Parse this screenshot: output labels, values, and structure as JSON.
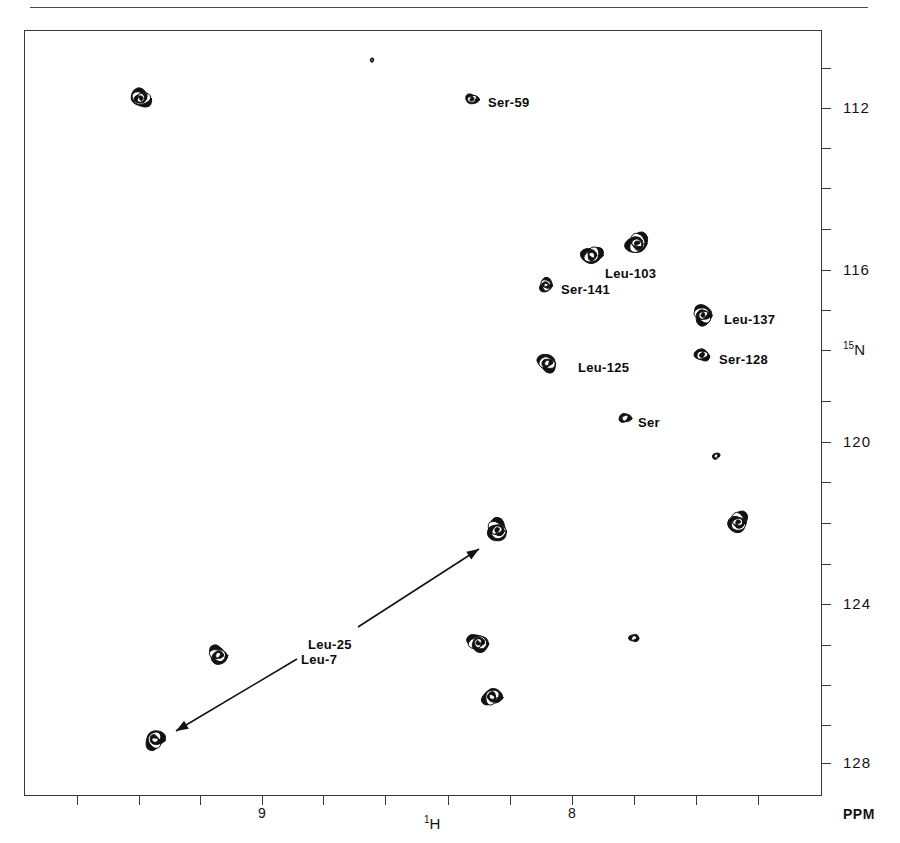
{
  "figure": {
    "kind": "2D NMR HSQC contour spectrum",
    "top_rule": true
  },
  "axes": {
    "x": {
      "title_pre": "1",
      "title": "H",
      "unit": "PPM",
      "labels": [
        "9",
        "8"
      ],
      "label_positions_px": [
        262,
        572
      ],
      "tick_positions_px": [
        77,
        139,
        200,
        262,
        323,
        385,
        448,
        510,
        572,
        634,
        696,
        758
      ],
      "range_ppm": [
        9.6,
        7.0
      ],
      "direction": "decreasing-left-to-right"
    },
    "y": {
      "title_pre": "15",
      "title": "N",
      "unit": "PPM",
      "labels": [
        "112",
        "116",
        "120",
        "124",
        "128"
      ],
      "label_positions_px": [
        108,
        270,
        442,
        604,
        763
      ],
      "tick_positions_px": [
        68,
        108,
        148,
        188,
        229,
        270,
        310,
        350,
        401,
        442,
        482,
        523,
        564,
        604,
        645,
        685,
        725,
        763
      ],
      "range_ppm": [
        110.2,
        128.4
      ],
      "direction": "increasing-top-to-bottom"
    }
  },
  "chart_data": {
    "type": "scatter",
    "title": "",
    "xlabel": "1H",
    "ylabel": "15N",
    "xlim": [
      9.6,
      7.0
    ],
    "ylim": [
      128.4,
      110.2
    ],
    "grid": false,
    "legend": "none",
    "peaks": [
      {
        "label": "",
        "x_px": 141,
        "y_px": 98,
        "h1_ppm": 9.21,
        "n15_ppm": 111.8,
        "size": 20,
        "rings": 4
      },
      {
        "label": "Ser-59",
        "x_px": 472,
        "y_px": 99,
        "h1_ppm": 8.14,
        "n15_ppm": 111.8,
        "size": 12,
        "rings": 2
      },
      {
        "label": "",
        "x_px": 592,
        "y_px": 255,
        "h1_ppm": 7.76,
        "n15_ppm": 115.7,
        "size": 20,
        "rings": 3
      },
      {
        "label": "Leu-103",
        "x_px": 637,
        "y_px": 243,
        "h1_ppm": 7.61,
        "n15_ppm": 115.4,
        "size": 22,
        "rings": 4
      },
      {
        "label": "Ser-141",
        "x_px": 546,
        "y_px": 285,
        "h1_ppm": 7.9,
        "n15_ppm": 116.5,
        "size": 14,
        "rings": 3
      },
      {
        "label": "Leu-137",
        "x_px": 703,
        "y_px": 315,
        "h1_ppm": 7.4,
        "n15_ppm": 117.2,
        "size": 20,
        "rings": 4
      },
      {
        "label": "Leu-125",
        "x_px": 547,
        "y_px": 363,
        "h1_ppm": 7.89,
        "n15_ppm": 118.4,
        "size": 19,
        "rings": 3
      },
      {
        "label": "Ser-128",
        "x_px": 702,
        "y_px": 355,
        "h1_ppm": 7.41,
        "n15_ppm": 118.2,
        "size": 14,
        "rings": 2
      },
      {
        "label": "Ser",
        "x_px": 625,
        "y_px": 418,
        "h1_ppm": 7.65,
        "n15_ppm": 119.8,
        "size": 11,
        "rings": 1
      },
      {
        "label": "",
        "x_px": 716,
        "y_px": 456,
        "h1_ppm": 7.36,
        "n15_ppm": 120.7,
        "size": 7,
        "rings": 1
      },
      {
        "label": "",
        "x_px": 738,
        "y_px": 522,
        "h1_ppm": 7.29,
        "n15_ppm": 122.4,
        "size": 21,
        "rings": 4
      },
      {
        "label": "",
        "x_px": 497,
        "y_px": 530,
        "h1_ppm": 8.06,
        "n15_ppm": 122.6,
        "size": 22,
        "rings": 4
      },
      {
        "label": "",
        "x_px": 218,
        "y_px": 655,
        "h1_ppm": 8.96,
        "n15_ppm": 125.7,
        "size": 19,
        "rings": 3
      },
      {
        "label": "",
        "x_px": 478,
        "y_px": 643,
        "h1_ppm": 8.12,
        "n15_ppm": 125.4,
        "size": 20,
        "rings": 4
      },
      {
        "label": "",
        "x_px": 634,
        "y_px": 638,
        "h1_ppm": 7.62,
        "n15_ppm": 125.3,
        "size": 9,
        "rings": 1
      },
      {
        "label": "",
        "x_px": 492,
        "y_px": 697,
        "h1_ppm": 8.07,
        "n15_ppm": 126.8,
        "size": 19,
        "rings": 3
      },
      {
        "label": "",
        "x_px": 155,
        "y_px": 740,
        "h1_ppm": 9.17,
        "n15_ppm": 127.9,
        "size": 20,
        "rings": 3
      },
      {
        "label": "",
        "x_px": 372,
        "y_px": 60,
        "h1_ppm": 8.46,
        "n15_ppm": 110.9,
        "size": 4,
        "rings": 1
      }
    ],
    "annotations": [
      {
        "text": "Ser-59",
        "x_px": 488,
        "y_px": 104
      },
      {
        "text": "Leu-103",
        "x_px": 605,
        "y_px": 275
      },
      {
        "text": "Ser-141",
        "x_px": 561,
        "y_px": 291
      },
      {
        "text": "Leu-137",
        "x_px": 724,
        "y_px": 321
      },
      {
        "text": "Ser-128",
        "x_px": 719,
        "y_px": 361
      },
      {
        "text": "Leu-125",
        "x_px": 578,
        "y_px": 369
      },
      {
        "text": "Ser",
        "x_px": 638,
        "y_px": 424
      },
      {
        "text": "Leu-25",
        "x_px": 308,
        "y_px": 646
      },
      {
        "text": "Leu-7",
        "x_px": 301,
        "y_px": 661
      }
    ],
    "arrows": [
      {
        "name": "leu-25-arrow",
        "from_px": [
          358,
          627
        ],
        "to_px": [
          479,
          549
        ]
      },
      {
        "name": "leu-7-arrow",
        "from_px": [
          297,
          659
        ],
        "to_px": [
          176,
          731
        ]
      }
    ]
  }
}
